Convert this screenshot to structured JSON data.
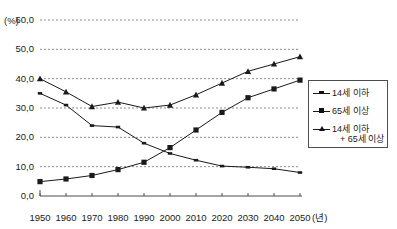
{
  "chart_data": {
    "type": "line",
    "title": "",
    "subtitle": "",
    "xlabel": "(년)",
    "ylabel": "(%)",
    "x": [
      1950,
      1960,
      1970,
      1980,
      1990,
      2000,
      2010,
      2020,
      2030,
      2040,
      2050
    ],
    "categories": [
      "1950",
      "1960",
      "1970",
      "1980",
      "1990",
      "2000",
      "2010",
      "2020",
      "2030",
      "2040",
      "2050"
    ],
    "xlim": [
      1950,
      2050
    ],
    "ylim": [
      0.0,
      60.0
    ],
    "ytick_labels": [
      "60,0",
      "50,0",
      "40,0",
      "30,0",
      "20,0",
      "10,0",
      "0,0"
    ],
    "ytick_values": [
      60.0,
      50.0,
      40.0,
      30.0,
      20.0,
      10.0,
      0.0
    ],
    "grid": true,
    "grid_style": "dotted-horizontal",
    "legend_position": "right",
    "series": [
      {
        "name": "14세 이하",
        "marker": "small-dash",
        "values": [
          35.0,
          31.0,
          24.0,
          23.5,
          18.0,
          14.5,
          12.2,
          10.2,
          9.8,
          9.3,
          8.0
        ]
      },
      {
        "name": "65세 이상",
        "marker": "square",
        "values": [
          4.9,
          5.8,
          7.0,
          9.0,
          11.5,
          16.5,
          22.5,
          28.5,
          33.5,
          36.5,
          39.5
        ]
      },
      {
        "name": "14세 이하 + 65세 이상",
        "marker": "triangle",
        "values": [
          40.0,
          35.5,
          30.5,
          32.0,
          30.0,
          31.0,
          34.5,
          38.5,
          42.5,
          45.0,
          47.5
        ]
      }
    ]
  },
  "axes": {
    "y_unit": "(%)",
    "x_unit": "(년)"
  },
  "legend": {
    "entries": [
      {
        "label": "14세 이하",
        "label_line2": "",
        "marker": "small-dash"
      },
      {
        "label": "65세 이상",
        "label_line2": "",
        "marker": "square"
      },
      {
        "label": "14세 이하",
        "label_line2": "+ 65세 이상",
        "marker": "triangle"
      }
    ]
  },
  "colors": {
    "line": "#1a1a1a",
    "grid": "#8c8c8c",
    "axis": "#4d4d4d",
    "background": "#ffffff"
  }
}
